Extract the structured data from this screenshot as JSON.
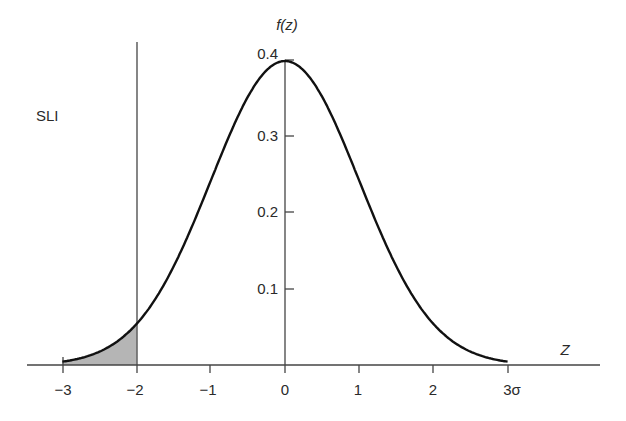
{
  "chart_data": {
    "type": "line",
    "title": "",
    "xlabel": "Z",
    "ylabel": "f(z)",
    "x_ticks": [
      "-3",
      "-2",
      "-1",
      "0",
      "1",
      "2",
      "3σ"
    ],
    "x_tick_values": [
      -3,
      -2,
      -1,
      0,
      1,
      2,
      3
    ],
    "y_ticks": [
      "0.1",
      "0.2",
      "0.3",
      "0.4"
    ],
    "y_tick_values": [
      0.1,
      0.2,
      0.3,
      0.4
    ],
    "xlim": [
      -3,
      3
    ],
    "ylim": [
      0,
      0.4
    ],
    "grid": false,
    "series": [
      {
        "name": "Standard normal density f(z)",
        "x": [
          -3,
          -2.5,
          -2,
          -1.5,
          -1,
          -0.5,
          0,
          0.5,
          1,
          1.5,
          2,
          2.5,
          3
        ],
        "values": [
          0.0044,
          0.0175,
          0.054,
          0.1295,
          0.242,
          0.3521,
          0.3989,
          0.3521,
          0.242,
          0.1295,
          0.054,
          0.0175,
          0.0044
        ]
      }
    ],
    "shaded_region": {
      "from": -3,
      "to": -2,
      "description": "Area under curve left of SLI"
    },
    "vertical_line": {
      "x": -2,
      "label": "SLI"
    },
    "annotations": [
      "SLI"
    ]
  },
  "labels": {
    "sli": "SLI",
    "y_axis_title": "f(z)",
    "x_axis_title": "Z",
    "x_ticks": [
      "−3",
      "−2",
      "−1",
      "0",
      "1",
      "2",
      "3σ"
    ],
    "y_ticks": [
      "0.1",
      "0.2",
      "0.3",
      "0.4"
    ]
  },
  "colors": {
    "curve": "#111111",
    "axis": "#444444",
    "shade": "#b5b5b5"
  }
}
